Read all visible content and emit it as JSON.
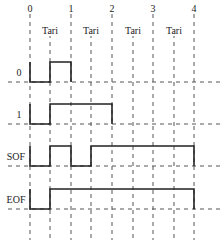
{
  "diagram": {
    "title": "",
    "time_ticks": [
      "0",
      "1",
      "2",
      "3",
      "4"
    ],
    "interval_label": "Tari",
    "interval_labels": [
      "Tari",
      "Tari",
      "Tari",
      "Tari"
    ],
    "signals": [
      {
        "label": "0",
        "description": "low 0–0.5, high 0.5–1"
      },
      {
        "label": "1",
        "description": "low 0–0.5, high 0.5–2"
      },
      {
        "label": "SOF",
        "description": "low 0–0.5, high 0.5–1, low 1–1.5, high 1.5–4"
      },
      {
        "label": "EOF",
        "description": "low 0–0.5, high 0.5–4"
      }
    ],
    "colors": {
      "line": "#222222",
      "dash": "#555555"
    }
  }
}
